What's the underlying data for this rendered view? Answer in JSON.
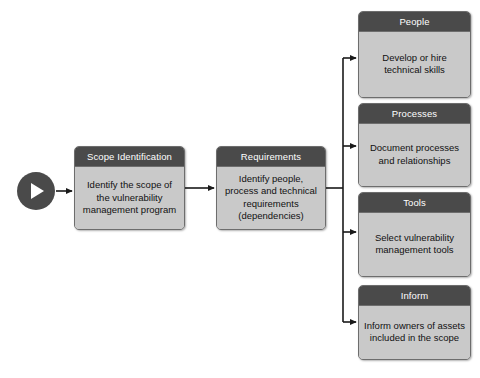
{
  "diagram": {
    "type": "flowchart",
    "orientation": "left-to-right",
    "background_color": "#ffffff",
    "header_color": "#4a4a4a",
    "body_color": "#c9c9c9",
    "border_color": "#6d6d6d",
    "connector_color": "#1a1a1a",
    "start_marker": {
      "name": "start",
      "icon": "play-icon",
      "shape": "circle",
      "color": "#4a4a4a"
    },
    "nodes": [
      {
        "id": "scope",
        "title": "Scope Identification",
        "body": "Identify the scope of the vulnerability management program"
      },
      {
        "id": "requirements",
        "title": "Requirements",
        "body": "Identify people, process and technical requirements (dependencies)"
      },
      {
        "id": "people",
        "title": "People",
        "body": "Develop or hire technical skills"
      },
      {
        "id": "processes",
        "title": "Processes",
        "body": "Document processes and relationships"
      },
      {
        "id": "tools",
        "title": "Tools",
        "body": "Select vulnerability management tools"
      },
      {
        "id": "inform",
        "title": "Inform",
        "body": "Inform owners of assets included in the scope"
      }
    ],
    "edges": [
      {
        "from": "start",
        "to": "scope"
      },
      {
        "from": "scope",
        "to": "requirements"
      },
      {
        "from": "requirements",
        "to": "people"
      },
      {
        "from": "requirements",
        "to": "processes"
      },
      {
        "from": "requirements",
        "to": "tools"
      },
      {
        "from": "requirements",
        "to": "inform"
      }
    ]
  }
}
